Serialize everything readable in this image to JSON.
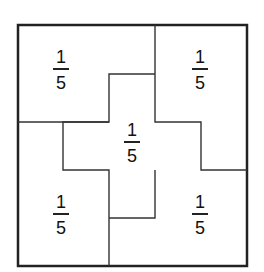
{
  "diagram": {
    "outer_box": {
      "x": 18,
      "y": 25,
      "width": 229,
      "height": 241
    },
    "line_color": "#333333",
    "regions": [
      {
        "id": "top-left",
        "numerator": "1",
        "denominator": "5",
        "cx": 61,
        "bar_y": 73
      },
      {
        "id": "top-right",
        "numerator": "1",
        "denominator": "5",
        "cx": 200,
        "bar_y": 73
      },
      {
        "id": "center",
        "numerator": "1",
        "denominator": "5",
        "cx": 132,
        "bar_y": 146
      },
      {
        "id": "bottom-left",
        "numerator": "1",
        "denominator": "5",
        "cx": 61,
        "bar_y": 218
      },
      {
        "id": "bottom-right",
        "numerator": "1",
        "denominator": "5",
        "cx": 200,
        "bar_y": 218
      }
    ]
  }
}
